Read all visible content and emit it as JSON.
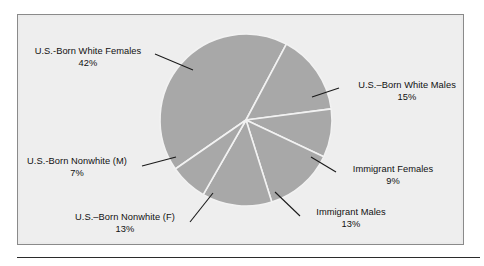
{
  "chart_data": {
    "type": "pie",
    "title": "",
    "subtitle": "",
    "xlabel": "",
    "ylabel": "",
    "legend_position": "none",
    "grid": false,
    "units": "percent",
    "colors": {
      "slice_fill": "#a8a8a8",
      "slice_border": "#f2f2f2",
      "panel_background": "#eeeeee",
      "panel_border": "#8a8a8a",
      "label_text": "#111111",
      "leader_line": "#1a1a1a",
      "bottom_rule": "#2b2b2b"
    },
    "categories": [
      "U.S.-Born White Females",
      "U.S.–Born White Males",
      "Immigrant Females",
      "Immigrant Males",
      "U.S.–Born Nonwhite (F)",
      "U.S.-Born Nonwhite (M)"
    ],
    "values": [
      42,
      15,
      9,
      13,
      13,
      7
    ],
    "slices": [
      {
        "label": "U.S.-Born White Females",
        "percent_text": "42%",
        "value": 42,
        "start_angle_deg": -62,
        "end_angle_deg": 89.2,
        "label_position": "upper-left"
      },
      {
        "label": "U.S.–Born White Males",
        "percent_text": "15%",
        "value": 15,
        "start_angle_deg": -62,
        "end_angle_deg": -8,
        "label_position": "right-upper"
      },
      {
        "label": "Immigrant Females",
        "percent_text": "9%",
        "value": 9,
        "start_angle_deg": -8,
        "end_angle_deg": 24.4,
        "label_position": "right-lower"
      },
      {
        "label": "Immigrant Males",
        "percent_text": "13%",
        "value": 13,
        "start_angle_deg": 24.4,
        "end_angle_deg": 71.2,
        "label_position": "bottom-right"
      },
      {
        "label": "U.S.–Born Nonwhite (F)",
        "percent_text": "13%",
        "value": 13,
        "start_angle_deg": 71.2,
        "end_angle_deg": 118,
        "label_position": "bottom-left"
      },
      {
        "label": "U.S.-Born Nonwhite (M)",
        "percent_text": "7%",
        "value": 7,
        "start_angle_deg": 118,
        "end_angle_deg": 143.2,
        "label_position": "left-middle"
      }
    ]
  },
  "labels": {
    "white_females": {
      "name": "U.S.-Born White Females",
      "percent": "42%"
    },
    "white_males": {
      "name": "U.S.–Born White Males",
      "percent": "15%"
    },
    "immigrant_females": {
      "name": "Immigrant Females",
      "percent": "9%"
    },
    "immigrant_males": {
      "name": "Immigrant Males",
      "percent": "13%"
    },
    "nonwhite_f": {
      "name": "U.S.–Born Nonwhite (F)",
      "percent": "13%"
    },
    "nonwhite_m": {
      "name": "U.S.-Born Nonwhite (M)",
      "percent": "7%"
    }
  }
}
